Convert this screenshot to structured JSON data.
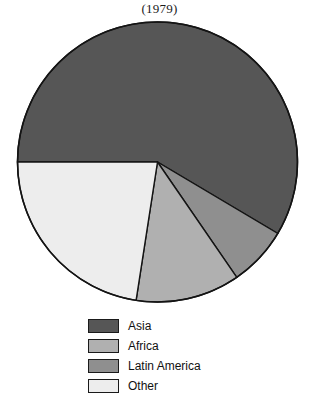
{
  "chart_data": {
    "type": "pie",
    "title": "(1979)",
    "xlabel": "",
    "ylabel": "",
    "legend_position": "bottom",
    "grid": false,
    "start_angle_deg": 180,
    "direction": "clockwise",
    "center": {
      "cx": 157.5,
      "cy": 162,
      "r": 140
    },
    "categories": [
      "Asia",
      "Africa",
      "Latin America",
      "Other"
    ],
    "values": [
      58.5,
      12.0,
      6.9,
      22.6
    ],
    "slices": [
      {
        "label": "Asia",
        "value": 58.5,
        "color": "#565656",
        "start_deg": 180,
        "end_deg": 390.7,
        "sweep_deg": 210.7
      },
      {
        "label": "Latin America",
        "value": 6.9,
        "color": "#8f8f8f",
        "start_deg": 30.7,
        "end_deg": 55.5,
        "sweep_deg": 24.8
      },
      {
        "label": "Africa",
        "value": 12.0,
        "color": "#b0b0b0",
        "start_deg": 55.5,
        "end_deg": 98.8,
        "sweep_deg": 43.3
      },
      {
        "label": "Other",
        "value": 22.6,
        "color": "#ededed",
        "start_deg": 98.8,
        "end_deg": 180,
        "sweep_deg": 81.2
      }
    ],
    "outline_color": "#141414",
    "background_color": "#ffffff"
  },
  "legend": {
    "items": [
      {
        "label": "Asia",
        "color": "#565656"
      },
      {
        "label": "Africa",
        "color": "#b0b0b0"
      },
      {
        "label": "Latin America",
        "color": "#8f8f8f"
      },
      {
        "label": "Other",
        "color": "#ededed"
      }
    ]
  }
}
